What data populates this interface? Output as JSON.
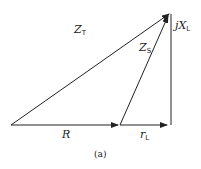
{
  "diagram": {
    "labels": {
      "zt": {
        "main": "Z",
        "sub": "T"
      },
      "zs": {
        "main": "Z",
        "sub": "S"
      },
      "xl": {
        "prefix": "j",
        "main": "X",
        "sub": "L"
      },
      "r": {
        "main": "R"
      },
      "rl": {
        "main": "r",
        "sub": "L"
      }
    },
    "caption": "(a)",
    "colors": {
      "line": "#222222",
      "background": "#ffffff"
    }
  }
}
